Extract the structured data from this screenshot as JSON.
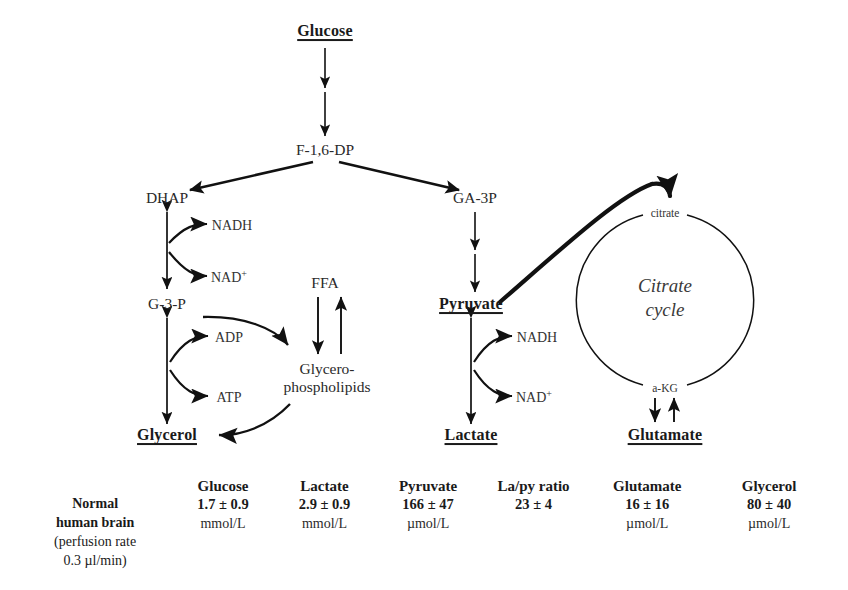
{
  "diagram": {
    "title_nodes": {
      "glucose": "Glucose",
      "f16dp": "F-1,6-DP",
      "dhap": "DHAP",
      "ga3p": "GA-3P",
      "g3p": "G-3-P",
      "glycerol": "Glycerol",
      "pyruvate": "Pyruvate",
      "lactate": "Lactate",
      "glutamate": "Glutamate",
      "ffa": "FFA",
      "glycerophospholipids_line1": "Glycero-",
      "glycerophospholipids_line2": "phospholipids",
      "citrate": "citrate",
      "akg": "a-KG",
      "cycle_line1": "Citrate",
      "cycle_line2": "cycle"
    },
    "cofactors": {
      "nadh_upper": "NADH",
      "nad_upper": "NAD",
      "adp": "ADP",
      "atp": "ATP",
      "nadh_lower": "NADH",
      "nad_lower": "NAD",
      "plus_sign": "+"
    },
    "colors": {
      "ink": "#1a1a1a",
      "line": "#111111",
      "background": "#ffffff"
    }
  },
  "table": {
    "row_label": {
      "line1": "Normal",
      "line2": "human brain",
      "line3": "(perfusion rate",
      "line4": "0.3 µl/min)"
    },
    "columns": [
      {
        "header": "Glucose",
        "value": "1.7 ± 0.9",
        "unit": "mmol/L"
      },
      {
        "header": "Lactate",
        "value": "2.9 ± 0.9",
        "unit": "mmol/L"
      },
      {
        "header": "Pyruvate",
        "value": "166 ± 47",
        "unit": "µmol/L"
      },
      {
        "header": "La/py ratio",
        "value": "23 ± 4",
        "unit": ""
      },
      {
        "header": "Glutamate",
        "value": "16 ± 16",
        "unit": "µmol/L"
      },
      {
        "header": "Glycerol",
        "value": "80 ± 40",
        "unit": "µmol/L"
      }
    ]
  }
}
